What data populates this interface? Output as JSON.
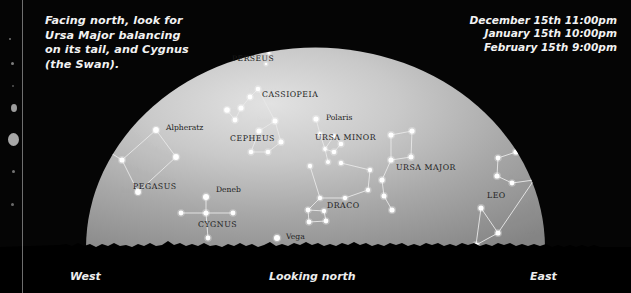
{
  "meta": {
    "caption_note": "Facing north, look for\nUrsa Major balancing\non its tail, and Cygnus\n(the Swan).",
    "width": 631,
    "height": 293
  },
  "times": {
    "lines": [
      "December 15th 11:00pm",
      "January 15th 10:00pm",
      "February 15th 9:00pm"
    ]
  },
  "compass": {
    "west": "West",
    "center": "Looking north",
    "east": "East"
  },
  "colors": {
    "background": "#050505",
    "sky_bright": "#d8d8d8",
    "sky_dim": "#8d8d8d",
    "star": "#ffffff",
    "line": "#e8e8e8",
    "label_dark": "#1c1c1c",
    "label_light": "#f2f2f2",
    "horizon": "#000000"
  },
  "chart_data": {
    "type": "scatter",
    "xlabel": "Looking north",
    "ylabel": "",
    "xlim": [
      0,
      631
    ],
    "ylim": [
      293,
      0
    ],
    "grid": false,
    "legend": "none",
    "constellation_labels": [
      {
        "text": "PERSEUS",
        "x": 232,
        "y": 61,
        "size": 7.6,
        "style": "caps"
      },
      {
        "text": "CASSIOPEIA",
        "x": 262,
        "y": 97,
        "size": 7.8,
        "style": "caps"
      },
      {
        "text": "CEPHEUS",
        "x": 230,
        "y": 141,
        "size": 7.8,
        "style": "caps"
      },
      {
        "text": "URSA MINOR",
        "x": 315,
        "y": 140,
        "size": 7.8,
        "style": "caps"
      },
      {
        "text": "URSA MAJOR",
        "x": 396,
        "y": 170,
        "size": 7.8,
        "style": "caps"
      },
      {
        "text": "DRACO",
        "x": 327,
        "y": 208,
        "size": 7.8,
        "style": "caps"
      },
      {
        "text": "PEGASUS",
        "x": 133,
        "y": 189,
        "size": 7.8,
        "style": "caps"
      },
      {
        "text": "CYGNUS",
        "x": 198,
        "y": 227,
        "size": 7.8,
        "style": "caps"
      },
      {
        "text": "LEO",
        "x": 487,
        "y": 198,
        "size": 7.8,
        "style": "caps"
      }
    ],
    "star_labels": [
      {
        "text": "Alpheratz",
        "x": 166,
        "y": 130,
        "size": 7.6
      },
      {
        "text": "Polaris",
        "x": 326,
        "y": 120,
        "size": 7.6
      },
      {
        "text": "Deneb",
        "x": 216,
        "y": 192,
        "size": 7.6
      },
      {
        "text": "Vega",
        "x": 286,
        "y": 239,
        "size": 7.6
      }
    ],
    "stars": [
      {
        "name": "perseus-a",
        "x": 269,
        "y": 53,
        "r": 1.5
      },
      {
        "name": "perseus-b",
        "x": 266,
        "y": 64,
        "r": 1.3
      },
      {
        "name": "cass-1",
        "x": 227,
        "y": 110,
        "r": 2.8
      },
      {
        "name": "cass-2",
        "x": 235,
        "y": 120,
        "r": 2.4
      },
      {
        "name": "cass-3",
        "x": 241,
        "y": 108,
        "r": 2.6
      },
      {
        "name": "cass-4",
        "x": 250,
        "y": 97,
        "r": 2.4
      },
      {
        "name": "cass-5",
        "x": 258,
        "y": 89,
        "r": 2.3
      },
      {
        "name": "ceph-1",
        "x": 259,
        "y": 131,
        "r": 2.6
      },
      {
        "name": "ceph-2",
        "x": 275,
        "y": 121,
        "r": 2.5
      },
      {
        "name": "ceph-3",
        "x": 281,
        "y": 142,
        "r": 2.5
      },
      {
        "name": "ceph-4",
        "x": 268,
        "y": 152,
        "r": 2.3
      },
      {
        "name": "ceph-5",
        "x": 251,
        "y": 152,
        "r": 2.3
      },
      {
        "name": "polaris",
        "x": 316,
        "y": 119,
        "r": 2.6
      },
      {
        "name": "umi-2",
        "x": 320,
        "y": 134,
        "r": 1.9
      },
      {
        "name": "umi-3",
        "x": 325,
        "y": 149,
        "r": 1.9
      },
      {
        "name": "umi-4",
        "x": 334,
        "y": 152,
        "r": 2.3
      },
      {
        "name": "umi-5",
        "x": 341,
        "y": 144,
        "r": 2.3
      },
      {
        "name": "umi-6",
        "x": 334,
        "y": 136,
        "r": 1.9
      },
      {
        "name": "umi-7",
        "x": 328,
        "y": 162,
        "r": 2.1
      },
      {
        "name": "uma-1",
        "x": 391,
        "y": 135,
        "r": 2.6
      },
      {
        "name": "uma-2",
        "x": 412,
        "y": 131,
        "r": 2.6
      },
      {
        "name": "uma-3",
        "x": 411,
        "y": 157,
        "r": 2.5
      },
      {
        "name": "uma-4",
        "x": 391,
        "y": 160,
        "r": 2.6
      },
      {
        "name": "uma-5",
        "x": 382,
        "y": 180,
        "r": 2.6
      },
      {
        "name": "uma-6",
        "x": 384,
        "y": 196,
        "r": 2.5
      },
      {
        "name": "uma-7",
        "x": 392,
        "y": 210,
        "r": 2.6
      },
      {
        "name": "dra-1",
        "x": 341,
        "y": 163,
        "r": 2.2
      },
      {
        "name": "dra-2",
        "x": 370,
        "y": 170,
        "r": 2.2
      },
      {
        "name": "dra-3",
        "x": 368,
        "y": 190,
        "r": 2.2
      },
      {
        "name": "dra-4",
        "x": 345,
        "y": 198,
        "r": 2.2
      },
      {
        "name": "dra-5",
        "x": 320,
        "y": 198,
        "r": 2.2
      },
      {
        "name": "dra-6",
        "x": 310,
        "y": 166,
        "r": 2.2
      },
      {
        "name": "dra-7",
        "x": 308,
        "y": 210,
        "r": 2.4
      },
      {
        "name": "dra-8",
        "x": 324,
        "y": 211,
        "r": 2.2
      },
      {
        "name": "dra-9",
        "x": 326,
        "y": 221,
        "r": 2.4
      },
      {
        "name": "dra-10",
        "x": 309,
        "y": 222,
        "r": 2.4
      },
      {
        "name": "alpheratz",
        "x": 156,
        "y": 130,
        "r": 2.9
      },
      {
        "name": "peg-2",
        "x": 176,
        "y": 157,
        "r": 2.9
      },
      {
        "name": "peg-3",
        "x": 138,
        "y": 192,
        "r": 2.9
      },
      {
        "name": "peg-4",
        "x": 122,
        "y": 160,
        "r": 2.6
      },
      {
        "name": "peg-5",
        "x": 106,
        "y": 150,
        "r": 2.4
      },
      {
        "name": "deneb",
        "x": 206,
        "y": 197,
        "r": 3.0
      },
      {
        "name": "cyg-cross-w",
        "x": 181,
        "y": 213,
        "r": 2.4
      },
      {
        "name": "cyg-center",
        "x": 206,
        "y": 213,
        "r": 2.6
      },
      {
        "name": "cyg-cross-e",
        "x": 233,
        "y": 213,
        "r": 2.4
      },
      {
        "name": "cyg-tail",
        "x": 208,
        "y": 238,
        "r": 2.4
      },
      {
        "name": "vega",
        "x": 277,
        "y": 238,
        "r": 3.0
      },
      {
        "name": "leo-s1",
        "x": 516,
        "y": 152,
        "r": 2.6
      },
      {
        "name": "leo-s2",
        "x": 498,
        "y": 158,
        "r": 2.4
      },
      {
        "name": "leo-s3",
        "x": 497,
        "y": 176,
        "r": 2.6
      },
      {
        "name": "leo-s4",
        "x": 512,
        "y": 183,
        "r": 2.4
      },
      {
        "name": "leo-s5",
        "x": 534,
        "y": 180,
        "r": 2.4
      },
      {
        "name": "leo-t1",
        "x": 481,
        "y": 208,
        "r": 2.6
      },
      {
        "name": "leo-t2",
        "x": 498,
        "y": 233,
        "r": 2.6
      },
      {
        "name": "leo-t3",
        "x": 476,
        "y": 245,
        "r": 2.6
      }
    ],
    "constellation_lines": [
      [
        "cass-1",
        "cass-2"
      ],
      [
        "cass-2",
        "cass-3"
      ],
      [
        "cass-3",
        "cass-4"
      ],
      [
        "cass-4",
        "cass-5"
      ],
      [
        "ceph-1",
        "ceph-2"
      ],
      [
        "ceph-2",
        "ceph-3"
      ],
      [
        "ceph-3",
        "ceph-4"
      ],
      [
        "ceph-4",
        "ceph-5"
      ],
      [
        "ceph-5",
        "ceph-1"
      ],
      [
        "ceph-2",
        "cass-5"
      ],
      [
        "polaris",
        "umi-2"
      ],
      [
        "umi-2",
        "umi-3"
      ],
      [
        "umi-3",
        "umi-4"
      ],
      [
        "umi-4",
        "umi-5"
      ],
      [
        "umi-5",
        "umi-6"
      ],
      [
        "umi-6",
        "umi-3"
      ],
      [
        "umi-3",
        "umi-7"
      ],
      [
        "uma-1",
        "uma-2"
      ],
      [
        "uma-2",
        "uma-3"
      ],
      [
        "uma-3",
        "uma-4"
      ],
      [
        "uma-4",
        "uma-1"
      ],
      [
        "uma-4",
        "uma-5"
      ],
      [
        "uma-5",
        "uma-6"
      ],
      [
        "uma-6",
        "uma-7"
      ],
      [
        "dra-1",
        "dra-2"
      ],
      [
        "dra-2",
        "dra-3"
      ],
      [
        "dra-3",
        "dra-4"
      ],
      [
        "dra-4",
        "dra-5"
      ],
      [
        "dra-5",
        "dra-6"
      ],
      [
        "dra-5",
        "dra-7"
      ],
      [
        "dra-7",
        "dra-8"
      ],
      [
        "dra-8",
        "dra-9"
      ],
      [
        "dra-9",
        "dra-10"
      ],
      [
        "dra-10",
        "dra-7"
      ],
      [
        "alpheratz",
        "peg-2"
      ],
      [
        "peg-2",
        "peg-3"
      ],
      [
        "peg-3",
        "peg-4"
      ],
      [
        "peg-4",
        "alpheratz"
      ],
      [
        "peg-4",
        "peg-5"
      ],
      [
        "deneb",
        "cyg-center"
      ],
      [
        "cyg-cross-w",
        "cyg-center"
      ],
      [
        "cyg-center",
        "cyg-cross-e"
      ],
      [
        "cyg-center",
        "cyg-tail"
      ],
      [
        "leo-s1",
        "leo-s2"
      ],
      [
        "leo-s2",
        "leo-s3"
      ],
      [
        "leo-s3",
        "leo-s4"
      ],
      [
        "leo-s4",
        "leo-s5"
      ],
      [
        "leo-s5",
        "leo-t2"
      ],
      [
        "leo-t1",
        "leo-t2"
      ],
      [
        "leo-t2",
        "leo-t3"
      ],
      [
        "leo-t3",
        "leo-t1"
      ]
    ]
  }
}
